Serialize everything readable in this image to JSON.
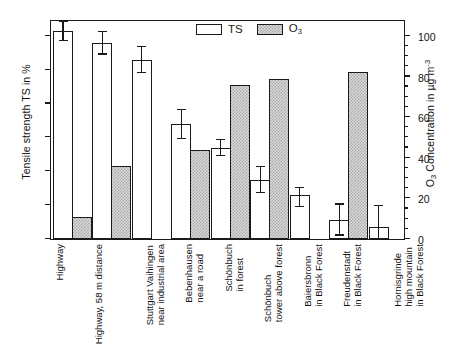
{
  "chart_data": {
    "type": "bar",
    "title": "",
    "xlabel": "",
    "ylabel": "Tensile strength TS in %",
    "ylabel_right": "O3 Concentration in µg m-3",
    "ylim": [
      0,
      130
    ],
    "ylim_right": [
      0,
      108.3
    ],
    "y_ticks": [
      0,
      20,
      40,
      60,
      80,
      100,
      120
    ],
    "y_ticks_right": [
      0,
      20,
      40,
      60,
      80,
      100
    ],
    "y_minor_step_right": 5,
    "grid": false,
    "legend_position": "top-center",
    "categories": [
      "Highway",
      "Highway, 58 m distance",
      "Stuttgart Vaihingen near industrial area",
      "Bebenhausen near a road",
      "Schönbuch in forest",
      "Schönbuch tower above forest",
      "Baiersbronn in Black Forest",
      "Freudenstadt in Black Forest",
      "Hornisgrinde high mountain in Black Forest"
    ],
    "category_lines": [
      [
        "Highway"
      ],
      [
        "Highway, 58 m distance"
      ],
      [
        "Stuttgart Vaihingen",
        "near industrial area"
      ],
      [
        "Bebenhausen",
        "near a road"
      ],
      [
        "Schönbuch",
        "in forest"
      ],
      [
        "Schönbuch",
        "tower above forest"
      ],
      [
        "Baiersbronn",
        "in Black Forest"
      ],
      [
        "Freudenstadt",
        "in Black Forest"
      ],
      [
        "Hornisgrinde",
        "high mountain",
        "in Black Forest"
      ]
    ],
    "series": [
      {
        "name": "TS",
        "unit": "%",
        "axis": "left",
        "values": [
          123,
          116,
          106,
          68,
          54,
          35,
          26,
          11,
          7
        ],
        "err_low": [
          117,
          109,
          98,
          59,
          49,
          27,
          19,
          2,
          0
        ],
        "err_high": [
          129,
          123,
          114,
          77,
          59,
          43,
          31,
          21,
          20
        ]
      },
      {
        "name": "O3",
        "unit": "µg m-3",
        "axis": "right",
        "values": [
          11,
          36,
          null,
          44,
          76,
          79,
          null,
          82,
          null
        ]
      }
    ]
  },
  "legend": {
    "items": [
      {
        "label": "TS",
        "sub": "",
        "style": "ts"
      },
      {
        "label": "O",
        "sub": "3",
        "style": "o3"
      }
    ]
  },
  "axes": {
    "left_title": "Tensile strength TS in %",
    "right_title_pre": "O",
    "right_title_sub": "3",
    "right_title_mid": " Concentration in µg m",
    "right_title_sup": "-3"
  }
}
